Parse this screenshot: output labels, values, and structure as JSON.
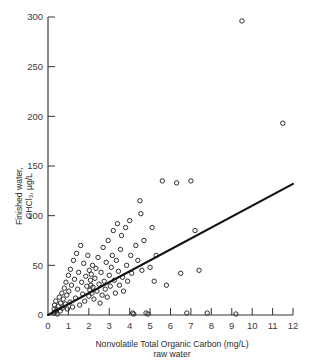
{
  "chart_data": {
    "type": "scatter",
    "title": "",
    "subtitle": "",
    "xlabel": "Nonvolatile Total Organic Carbon (mg/L)",
    "xlabel_line2": "raw water",
    "ylabel": "Finished water,",
    "ylabel_line2": "CHCl3, µg/L",
    "ylabel_line2_display": "CHCl₃, µg/L",
    "xlim": [
      0,
      12
    ],
    "ylim": [
      0,
      300
    ],
    "xticks": [
      0,
      1,
      2,
      3,
      4,
      5,
      6,
      7,
      8,
      9,
      10,
      11,
      12
    ],
    "xtick_labels": [
      "0",
      "1",
      "2",
      "3",
      "4",
      "5",
      "6",
      "7",
      "8",
      "9",
      "10",
      "11",
      "12"
    ],
    "yticks": [
      0,
      50,
      100,
      150,
      200,
      250,
      300
    ],
    "ytick_labels": [
      "0",
      "50",
      "100",
      "150",
      "200",
      "250",
      "300"
    ],
    "grid": false,
    "legend": false,
    "legend_position": "none",
    "marker_style": "open-circle",
    "marker_color": "#2e2e2e",
    "line_color": "#111111",
    "trend_line": {
      "name": "regression line",
      "x0": 0,
      "y0": 0,
      "x1": 12,
      "y1": 132,
      "slope": 11.0,
      "intercept": 0
    },
    "points": [
      [
        0.28,
        2
      ],
      [
        0.3,
        6
      ],
      [
        0.32,
        10
      ],
      [
        0.35,
        3
      ],
      [
        0.38,
        14
      ],
      [
        0.42,
        5
      ],
      [
        0.45,
        1
      ],
      [
        0.5,
        9
      ],
      [
        0.55,
        18
      ],
      [
        0.6,
        4
      ],
      [
        0.62,
        12
      ],
      [
        0.68,
        22
      ],
      [
        0.7,
        7
      ],
      [
        0.75,
        16
      ],
      [
        0.8,
        27
      ],
      [
        0.85,
        11
      ],
      [
        0.88,
        33
      ],
      [
        0.92,
        20
      ],
      [
        0.95,
        6
      ],
      [
        1.0,
        40
      ],
      [
        1.02,
        24
      ],
      [
        1.08,
        13
      ],
      [
        1.1,
        46
      ],
      [
        1.15,
        30
      ],
      [
        1.2,
        8
      ],
      [
        1.25,
        55
      ],
      [
        1.3,
        36
      ],
      [
        1.35,
        17
      ],
      [
        1.4,
        62
      ],
      [
        1.45,
        26
      ],
      [
        1.5,
        43
      ],
      [
        1.55,
        10
      ],
      [
        1.6,
        70
      ],
      [
        1.65,
        33
      ],
      [
        1.7,
        21
      ],
      [
        1.75,
        52
      ],
      [
        1.8,
        14
      ],
      [
        1.85,
        39
      ],
      [
        1.9,
        29
      ],
      [
        1.95,
        60
      ],
      [
        2.0,
        19
      ],
      [
        2.02,
        45
      ],
      [
        2.05,
        25
      ],
      [
        2.08,
        35
      ],
      [
        2.1,
        30
      ],
      [
        2.12,
        41
      ],
      [
        2.15,
        22
      ],
      [
        2.18,
        50
      ],
      [
        2.2,
        28
      ],
      [
        2.25,
        16
      ],
      [
        2.3,
        37
      ],
      [
        2.35,
        47
      ],
      [
        2.4,
        24
      ],
      [
        2.45,
        58
      ],
      [
        2.5,
        31
      ],
      [
        2.55,
        12
      ],
      [
        2.6,
        43
      ],
      [
        2.65,
        20
      ],
      [
        2.7,
        68
      ],
      [
        2.75,
        34
      ],
      [
        2.8,
        26
      ],
      [
        2.85,
        53
      ],
      [
        2.9,
        18
      ],
      [
        2.95,
        75
      ],
      [
        3.0,
        40
      ],
      [
        3.05,
        29
      ],
      [
        3.1,
        48
      ],
      [
        3.15,
        60
      ],
      [
        3.2,
        85
      ],
      [
        3.25,
        35
      ],
      [
        3.3,
        22
      ],
      [
        3.35,
        55
      ],
      [
        3.4,
        92
      ],
      [
        3.45,
        44
      ],
      [
        3.5,
        30
      ],
      [
        3.55,
        66
      ],
      [
        3.6,
        80
      ],
      [
        3.65,
        38
      ],
      [
        3.7,
        24
      ],
      [
        3.8,
        88
      ],
      [
        3.85,
        50
      ],
      [
        3.9,
        34
      ],
      [
        4.0,
        95
      ],
      [
        4.05,
        60
      ],
      [
        4.1,
        42
      ],
      [
        4.15,
        2
      ],
      [
        4.2,
        1
      ],
      [
        4.3,
        70
      ],
      [
        4.4,
        55
      ],
      [
        4.5,
        115
      ],
      [
        4.55,
        102
      ],
      [
        4.6,
        45
      ],
      [
        4.7,
        75
      ],
      [
        4.8,
        2
      ],
      [
        4.9,
        1
      ],
      [
        5.0,
        48
      ],
      [
        5.1,
        88
      ],
      [
        5.2,
        34
      ],
      [
        5.3,
        60
      ],
      [
        5.6,
        135
      ],
      [
        5.8,
        30
      ],
      [
        6.3,
        133
      ],
      [
        6.5,
        42
      ],
      [
        6.8,
        2
      ],
      [
        7.0,
        135
      ],
      [
        7.2,
        85
      ],
      [
        7.4,
        45
      ],
      [
        7.8,
        2
      ],
      [
        9.2,
        1
      ],
      [
        9.5,
        296
      ],
      [
        11.5,
        193
      ]
    ]
  }
}
